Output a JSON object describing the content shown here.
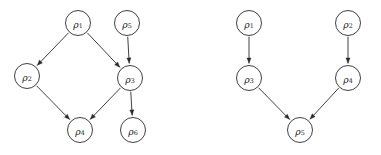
{
  "figure": {
    "type": "diagram",
    "subtype": "directed-acyclic-graph-pair",
    "background_color": "#ffffff",
    "stroke_color": "#2b2b2b",
    "label_color": "#1a1a1a",
    "node_radius": 12.5,
    "width": 381,
    "height": 155,
    "panel_count": 2
  },
  "graphs": [
    {
      "id": "left-graph",
      "name": "left-dag",
      "nodes": [
        {
          "id": "L1",
          "label": "ρ",
          "subscript": "1",
          "full_label": "ρ1",
          "cx": 78,
          "cy": 23,
          "r": 12.5
        },
        {
          "id": "L5",
          "label": "ρ",
          "subscript": "5",
          "full_label": "ρ5",
          "cx": 127,
          "cy": 23,
          "r": 12.5
        },
        {
          "id": "L2",
          "label": "ρ",
          "subscript": "2",
          "full_label": "ρ2",
          "cx": 27,
          "cy": 76,
          "r": 12.5
        },
        {
          "id": "L3",
          "label": "ρ",
          "subscript": "3",
          "full_label": "ρ3",
          "cx": 130,
          "cy": 78,
          "r": 12.5
        },
        {
          "id": "L4",
          "label": "ρ",
          "subscript": "4",
          "full_label": "ρ4",
          "cx": 80,
          "cy": 130,
          "r": 12.5
        },
        {
          "id": "L6",
          "label": "ρ",
          "subscript": "6",
          "full_label": "ρ6",
          "cx": 133,
          "cy": 130,
          "r": 12.5
        }
      ],
      "edges": [
        {
          "from": "L1",
          "to": "L2",
          "name": "edge-rho1-rho2"
        },
        {
          "from": "L1",
          "to": "L3",
          "name": "edge-rho1-rho3"
        },
        {
          "from": "L5",
          "to": "L3",
          "name": "edge-rho5-rho3"
        },
        {
          "from": "L2",
          "to": "L4",
          "name": "edge-rho2-rho4"
        },
        {
          "from": "L3",
          "to": "L4",
          "name": "edge-rho3-rho4"
        },
        {
          "from": "L3",
          "to": "L6",
          "name": "edge-rho3-rho6"
        }
      ]
    },
    {
      "id": "right-graph",
      "name": "right-dag",
      "nodes": [
        {
          "id": "R1",
          "label": "ρ",
          "subscript": "1",
          "full_label": "ρ1",
          "cx": 249,
          "cy": 23,
          "r": 12.5
        },
        {
          "id": "R2",
          "label": "ρ",
          "subscript": "2",
          "full_label": "ρ2",
          "cx": 348,
          "cy": 23,
          "r": 12.5
        },
        {
          "id": "R3",
          "label": "ρ",
          "subscript": "3",
          "full_label": "ρ3",
          "cx": 249,
          "cy": 78,
          "r": 12.5
        },
        {
          "id": "R4",
          "label": "ρ",
          "subscript": "4",
          "full_label": "ρ4",
          "cx": 348,
          "cy": 78,
          "r": 12.5
        },
        {
          "id": "R5",
          "label": "ρ",
          "subscript": "5",
          "full_label": "ρ5",
          "cx": 300,
          "cy": 130,
          "r": 12.5
        }
      ],
      "edges": [
        {
          "from": "R1",
          "to": "R3",
          "name": "edge-rho1-rho3"
        },
        {
          "from": "R2",
          "to": "R4",
          "name": "edge-rho2-rho4"
        },
        {
          "from": "R3",
          "to": "R5",
          "name": "edge-rho3-rho5"
        },
        {
          "from": "R4",
          "to": "R5",
          "name": "edge-rho4-rho5"
        }
      ]
    }
  ]
}
